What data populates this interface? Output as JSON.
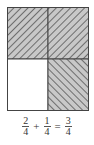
{
  "diagram": {
    "grid": {
      "rows": 2,
      "cols": 2,
      "cells": [
        {
          "row": 0,
          "col": 0,
          "shaded": true,
          "hatch": "forward"
        },
        {
          "row": 0,
          "col": 1,
          "shaded": true,
          "hatch": "forward"
        },
        {
          "row": 1,
          "col": 0,
          "shaded": false,
          "hatch": "none"
        },
        {
          "row": 1,
          "col": 1,
          "shaded": true,
          "hatch": "backward"
        }
      ],
      "colors": {
        "fill": "#c8c8c8",
        "hatch": "#555555",
        "border": "#444444",
        "empty": "#ffffff"
      }
    },
    "equation": {
      "terms": [
        {
          "numerator": "2",
          "denominator": "4"
        },
        {
          "operator": "+"
        },
        {
          "numerator": "1",
          "denominator": "4"
        },
        {
          "operator": "="
        },
        {
          "numerator": "3",
          "denominator": "4"
        }
      ],
      "op_plus": "+",
      "op_equals": "=",
      "f1": {
        "num": "2",
        "den": "4"
      },
      "f2": {
        "num": "1",
        "den": "4"
      },
      "f3": {
        "num": "3",
        "den": "4"
      }
    }
  }
}
